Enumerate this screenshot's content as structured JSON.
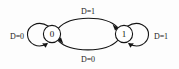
{
  "diagram": {
    "kind": "finite-state-machine",
    "title": "",
    "background_color": "#fdfdfd",
    "stroke_color": "#141414",
    "node_fill_color": "#ffffff",
    "text_color": "#111111",
    "states": [
      {
        "id": "s0",
        "label": "0",
        "cx": 52,
        "cy": 34,
        "r": 9
      },
      {
        "id": "s1",
        "label": "1",
        "cx": 124,
        "cy": 34,
        "r": 9
      }
    ],
    "transitions": [
      {
        "id": "t0-self",
        "from": "0",
        "to": "0",
        "label": "D=0",
        "kind": "self-loop",
        "side": "left",
        "label_x": 17,
        "label_y": 36
      },
      {
        "id": "t0-to-1",
        "from": "0",
        "to": "1",
        "label": "D=1",
        "kind": "curve",
        "side": "top",
        "label_x": 88,
        "label_y": 11
      },
      {
        "id": "t1-to-0",
        "from": "1",
        "to": "0",
        "label": "D=0",
        "kind": "curve",
        "side": "bottom",
        "label_x": 88,
        "label_y": 59
      },
      {
        "id": "t1-self",
        "from": "1",
        "to": "1",
        "label": "D=1",
        "kind": "self-loop",
        "side": "right",
        "label_x": 161,
        "label_y": 36
      }
    ]
  }
}
